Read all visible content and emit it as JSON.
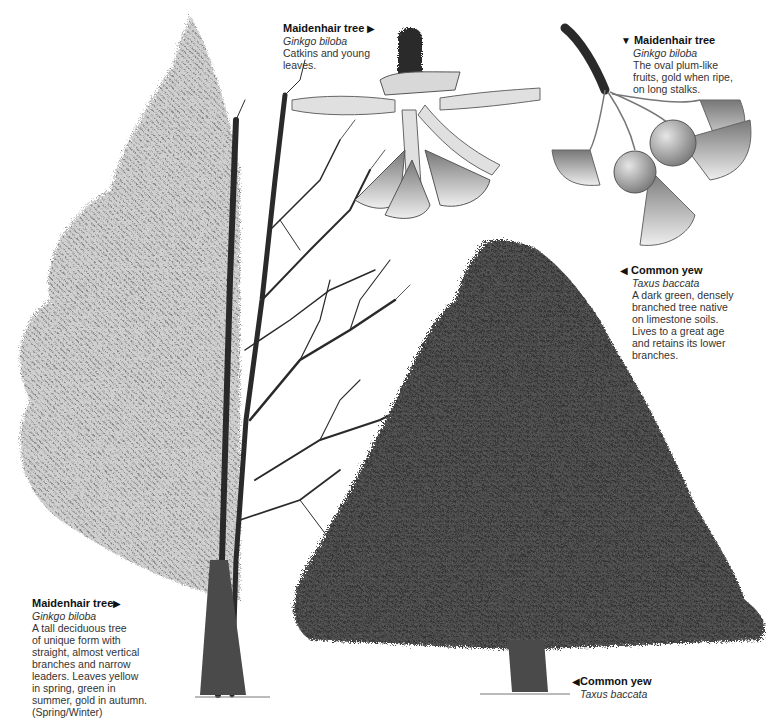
{
  "captions": {
    "catkins": {
      "name": "Maidenhair tree",
      "scientific": "Ginkgo biloba",
      "description": "Catkins and young\nleaves.",
      "pointer": "right",
      "pointer_glyph": "▶"
    },
    "fruits": {
      "name": "Maidenhair tree",
      "scientific": "Ginkgo biloba",
      "description": "The oval plum-like\nfruits, gold when ripe,\non long stalks.",
      "pointer": "down",
      "pointer_glyph": "▼"
    },
    "yew_detail": {
      "name": "Common yew",
      "scientific": "Taxus baccata",
      "description": "A dark green, densely\nbranched tree native\non limestone soils.\nLives to a great age\nand retains its lower\nbranches.",
      "pointer": "left",
      "pointer_glyph": "◀"
    },
    "ginkgo_tree": {
      "name": "Maidenhair tree",
      "scientific": "Ginkgo biloba",
      "description": "A tall deciduous tree\nof unique form with\nstraight, almost vertical\nbranches and narrow\nleaders. Leaves yellow\nin spring, green in\nsummer, gold in autumn.\n(Spring/Winter)",
      "pointer": "right",
      "pointer_glyph": "▶"
    },
    "yew_tree": {
      "name": "Common yew",
      "scientific": "Taxus baccata",
      "pointer": "left",
      "pointer_glyph": "◀"
    }
  },
  "illustrations": [
    {
      "id": "ginkgo-tree-spring-winter",
      "subject": "Maidenhair tree (half foliage, half bare branches)"
    },
    {
      "id": "ginkgo-catkins",
      "subject": "Catkins and young leaves"
    },
    {
      "id": "ginkgo-fruits",
      "subject": "Fruits on long stalks with fan leaves"
    },
    {
      "id": "yew-tree",
      "subject": "Common yew conical tree"
    }
  ],
  "colors": {
    "background": "#ffffff",
    "text": "#222222",
    "foliage_dark": "#3a3a3a",
    "foliage_light": "#9a9a9a",
    "bark": "#4a4a4a"
  }
}
